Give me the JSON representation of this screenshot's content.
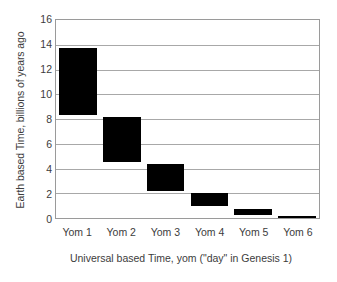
{
  "chart_data": {
    "type": "bar",
    "bar_style": "floating-range",
    "orientation": "vertical",
    "title": "",
    "subtitle": "",
    "xlabel": "Universal based Time, yom (\"day\" in Genesis 1)",
    "ylabel": "Earth based Time, billions of years ago",
    "categories": [
      "Yom 1",
      "Yom 2",
      "Yom 3",
      "Yom 4",
      "Yom 5",
      "Yom 6"
    ],
    "series": [
      {
        "name": "Earth based Time range",
        "ranges": [
          {
            "category": "Yom 1",
            "low": 8.3,
            "high": 13.7
          },
          {
            "category": "Yom 2",
            "low": 4.5,
            "high": 8.2
          },
          {
            "category": "Yom 3",
            "low": 2.2,
            "high": 4.4
          },
          {
            "category": "Yom 4",
            "low": 1.0,
            "high": 2.05
          },
          {
            "category": "Yom 5",
            "low": 0.25,
            "high": 0.7
          },
          {
            "category": "Yom 6",
            "low": 0.0,
            "high": 0.13
          }
        ],
        "color": "#000000"
      }
    ],
    "ylim": [
      0,
      16
    ],
    "ytick_labels": [
      "0",
      "2",
      "4",
      "6",
      "8",
      "10",
      "12",
      "14",
      "16"
    ],
    "ytick_values": [
      0,
      2,
      4,
      6,
      8,
      10,
      12,
      14,
      16
    ],
    "grid": {
      "horizontal": true,
      "vertical": false,
      "color": "#a8a8a8"
    },
    "legend": {
      "visible": false,
      "position": "none"
    },
    "plot_border_color": "#9a9a9a",
    "background_color": "#ffffff",
    "text_color": "#3c3c3c"
  }
}
